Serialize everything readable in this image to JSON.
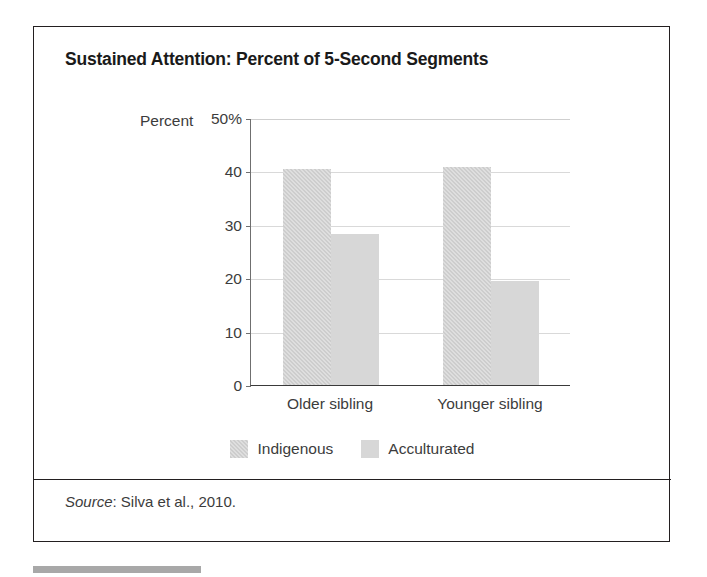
{
  "figure": {
    "title": "Sustained Attention: Percent of 5-Second Segments",
    "source_word": "Source",
    "source_rest": ": Silva et al., 2010."
  },
  "chart_data": {
    "type": "bar",
    "title": "Sustained Attention: Percent of 5-Second Segments",
    "xlabel": "",
    "ylabel": "Percent",
    "ylim": [
      0,
      50
    ],
    "yticks": [
      0,
      10,
      20,
      30,
      40,
      50
    ],
    "ytick_labels": [
      "0",
      "10",
      "20",
      "30",
      "40",
      "50%"
    ],
    "grid": true,
    "legend_position": "bottom-center",
    "categories": [
      "Older sibling",
      "Younger sibling"
    ],
    "series": [
      {
        "name": "Indigenous",
        "color": "#cdcdcd",
        "values": [
          40.5,
          40.8
        ]
      },
      {
        "name": "Acculturated",
        "color": "#d7d7d7",
        "values": [
          28.2,
          19.5
        ]
      }
    ]
  }
}
